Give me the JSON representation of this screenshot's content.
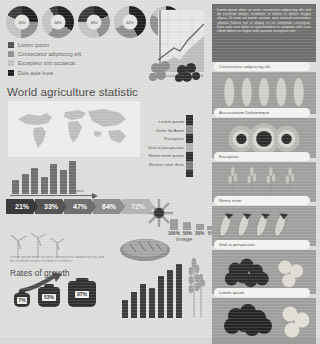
{
  "meta": {
    "background": "#dcdcda",
    "accent_dark": "#2e2e2e",
    "accent_mid": "#6e6e6e",
    "accent_light": "#b6b6b4"
  },
  "title": "World agriculture statistic",
  "donuts": {
    "labels": [
      "25%",
      "34%",
      "18%",
      "42%",
      "56%"
    ],
    "values": [
      25,
      34,
      18,
      42,
      56
    ]
  },
  "legend": {
    "items": [
      {
        "label": "Lorem ipsum",
        "color": "#4f4f4f"
      },
      {
        "label": "Consectetur adipiscing elit",
        "color": "#8e8e8e"
      },
      {
        "label": "Excepteur sint occaecat",
        "color": "#c2c2c2"
      },
      {
        "label": "Duis aute irure",
        "color": "#1f1f1f"
      }
    ]
  },
  "mini_chart": {
    "values": [
      14,
      20,
      26,
      17,
      30,
      24,
      33
    ],
    "axis_label": "year"
  },
  "percent_steps": {
    "values": [
      "21%",
      "33%",
      "47%",
      "64%",
      "72%"
    ],
    "colors": [
      "#3a3a3a",
      "#555555",
      "#6f6f6f",
      "#8d8d8d",
      "#b4b4b2"
    ]
  },
  "mid_list": {
    "items": [
      "Lorem ipsum",
      "Dolor Sit Amet",
      "Excepteur",
      "Sed ut perspiciatis",
      "Nemo enim ipsam",
      "Beatae vitae dicta"
    ]
  },
  "scale": {
    "items": [
      {
        "label": "100%",
        "height": 11
      },
      {
        "label": "50%",
        "height": 8
      },
      {
        "label": "30%",
        "height": 6
      },
      {
        "label": "5%",
        "height": 4
      }
    ]
  },
  "image_label": "image",
  "rates": {
    "subtext": "Lorem ipsum dolor sit amet, consectetur adipiscing elit, sed do eiusmod tempor incididunt ut labore.",
    "heading": "Rates of growth",
    "bags": [
      {
        "value": "7%",
        "w": 16,
        "h": 14
      },
      {
        "value": "53%",
        "w": 22,
        "h": 20
      },
      {
        "value": "97%",
        "w": 28,
        "h": 26
      }
    ]
  },
  "bottom_chart": {
    "values": [
      18,
      26,
      34,
      30,
      42,
      48,
      54
    ]
  },
  "dark_panel": {
    "text": "Lorem ipsum dolor sit amet, consectetur adipiscing elit, sed do eiusmod tempor incididunt ut labore et dolore magna aliqua. Ut enim ad minim veniam, quis nostrud exercitation ullamco laboris nisi ut aliquip ex ea commodo consequat. Duis aute irure dolor in reprehenderit in voluptate velit esse cillum dolore eu fugiat nulla pariatur excepteur sint."
  },
  "line_chart_caption": "Consectetur adipiscing elit",
  "right_cards": [
    {
      "caption": "Consectetur adipiscing elit",
      "kind": "corn"
    },
    {
      "caption": "Accusantium Doloremque",
      "kind": "sunflower"
    },
    {
      "caption": "Excepteur",
      "kind": "wheat-field"
    },
    {
      "caption": "Nemo enim",
      "kind": "grain"
    },
    {
      "caption": "Sed ut perspiciatis",
      "kind": "berries"
    },
    {
      "caption": "Lorem ipsum",
      "kind": "dark-berries"
    }
  ]
}
